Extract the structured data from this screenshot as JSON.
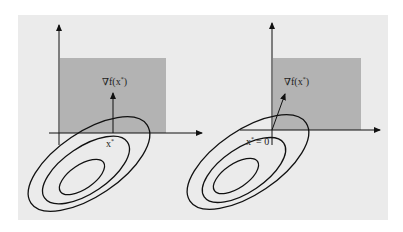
{
  "figure": {
    "background_color": "#ebebeb",
    "feasible_region_color": "#b3b3b3",
    "line_color": "#111111",
    "panels": [
      {
        "id": "left",
        "gradient_label": "∇f(x*)",
        "point_label": "x*",
        "description": "Optimum at interior of constraint boundary; gradient points straight up along normal"
      },
      {
        "id": "right",
        "gradient_label": "∇f(x*)",
        "point_label": "x* = 0",
        "description": "Optimum at corner (origin); gradient points into feasible region"
      }
    ]
  },
  "labels": {
    "left_grad_nabla": "∇f(x",
    "left_grad_star": "*",
    "left_grad_close": ")",
    "left_point_x": "x",
    "left_point_star": "*",
    "right_grad_nabla": "∇f(x",
    "right_grad_star": "*",
    "right_grad_close": ")",
    "right_point_x": "x",
    "right_point_star": "*",
    "right_point_eq": "= 0"
  }
}
